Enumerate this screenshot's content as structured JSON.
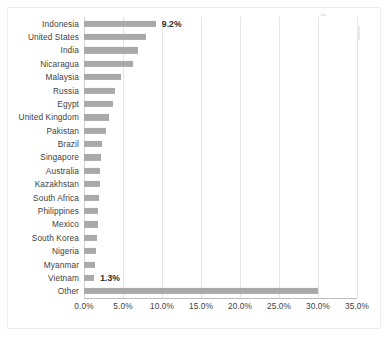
{
  "chart_data": {
    "type": "bar",
    "orientation": "horizontal",
    "title": "",
    "xlabel": "",
    "ylabel": "",
    "xlim": [
      0,
      35
    ],
    "grid": true,
    "legend": false,
    "bar_color": "#a9a9a9",
    "xticks": [
      "0.0%",
      "5.0%",
      "10.0%",
      "15.0%",
      "20.0%",
      "25.0%",
      "30.0%",
      "35.0%"
    ],
    "xtick_values": [
      0,
      5,
      10,
      15,
      20,
      25,
      30,
      35
    ],
    "categories": [
      "Indonesia",
      "United States",
      "India",
      "Nicaragua",
      "Malaysia",
      "Russia",
      "Egypt",
      "United Kingdom",
      "Pakistan",
      "Brazil",
      "Singapore",
      "Australia",
      "Kazakhstan",
      "South Africa",
      "Philippines",
      "Mexico",
      "South Korea",
      "Nigeria",
      "Myanmar",
      "Vietnam",
      "Other"
    ],
    "values": [
      9.2,
      8.0,
      6.9,
      6.3,
      4.7,
      4.0,
      3.7,
      3.2,
      2.8,
      2.3,
      2.2,
      2.1,
      2.0,
      1.9,
      1.8,
      1.8,
      1.7,
      1.6,
      1.4,
      1.3,
      30.0
    ],
    "point_labels": [
      {
        "category": "Indonesia",
        "label": "9.2%"
      },
      {
        "category": "Vietnam",
        "label": "1.3%"
      }
    ]
  }
}
